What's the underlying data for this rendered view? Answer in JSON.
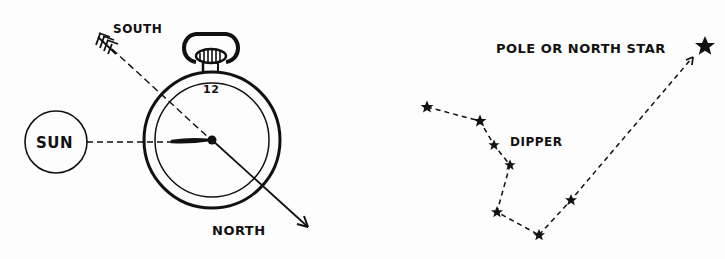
{
  "diagram": {
    "left_panel": {
      "labels": {
        "south": "SOUTH",
        "sun": "SUN",
        "north": "NORTH",
        "twelve": "12"
      },
      "ink_color": "#111111"
    },
    "right_panel": {
      "labels": {
        "pole_star": "POLE OR NORTH STAR",
        "dipper": "DIPPER"
      },
      "stars": [
        {
          "x": 427,
          "y": 107
        },
        {
          "x": 480,
          "y": 121
        },
        {
          "x": 494,
          "y": 145
        },
        {
          "x": 510,
          "y": 165
        },
        {
          "x": 497,
          "y": 212
        },
        {
          "x": 539,
          "y": 235
        },
        {
          "x": 571,
          "y": 200
        },
        {
          "x": 705,
          "y": 46
        }
      ]
    }
  }
}
